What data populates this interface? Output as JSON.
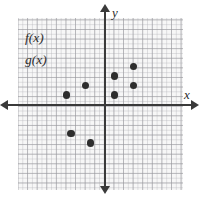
{
  "figure": {
    "name": "coordinate-plane-scatter",
    "background_color": "#ffffff",
    "grid_color": "#f7f7f7",
    "axis_color": "#3a3a3a",
    "point_color": "#2d2d2d"
  },
  "axes": {
    "x_label": "x",
    "y_label": "y",
    "x_arrow_left": "arrow-left-icon",
    "x_arrow_right": "arrow-right-icon",
    "y_arrow_up": "arrow-up-icon",
    "y_arrow_down": "arrow-down-icon"
  },
  "legend": {
    "entries": [
      {
        "label": "f(x)"
      },
      {
        "label": "g(x)"
      }
    ]
  },
  "chart_data": {
    "type": "scatter",
    "title": "",
    "xlabel": "x",
    "ylabel": "y",
    "grid": true,
    "legend_position": "top-left",
    "xlim": [
      -9,
      8
    ],
    "ylim": [
      -9,
      9
    ],
    "series": [
      {
        "name": "f(x)",
        "points": [
          {
            "x": -4,
            "y": 1
          },
          {
            "x": -2,
            "y": 2
          },
          {
            "x": 1,
            "y": 3
          },
          {
            "x": 3,
            "y": 4
          }
        ]
      },
      {
        "name": "g(x)",
        "points": [
          {
            "x": -3.5,
            "y": -3
          },
          {
            "x": -1.5,
            "y": -4
          },
          {
            "x": 1,
            "y": 1
          },
          {
            "x": 3,
            "y": 2
          }
        ]
      }
    ]
  }
}
